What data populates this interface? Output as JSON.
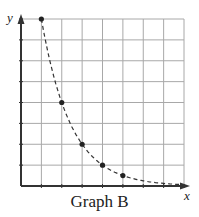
{
  "title": "Graph B",
  "chart_data": {
    "type": "scatter",
    "title": "Graph B",
    "xlabel": "x",
    "ylabel": "y",
    "xlim": [
      0,
      8
    ],
    "ylim": [
      0,
      8
    ],
    "grid": true,
    "x_ticks_unlabeled": true,
    "y_ticks_unlabeled": true,
    "series": [
      {
        "name": "points",
        "x": [
          1,
          2,
          3,
          4,
          5
        ],
        "y": [
          8,
          4,
          2,
          1,
          0.5
        ],
        "style": "dashed curve through points (exponential decay)"
      }
    ],
    "curve_extends_to": [
      8,
      0.06
    ]
  },
  "colors": {
    "grid": "#a8a8a8",
    "axis": "#333333",
    "curve": "#333333"
  }
}
